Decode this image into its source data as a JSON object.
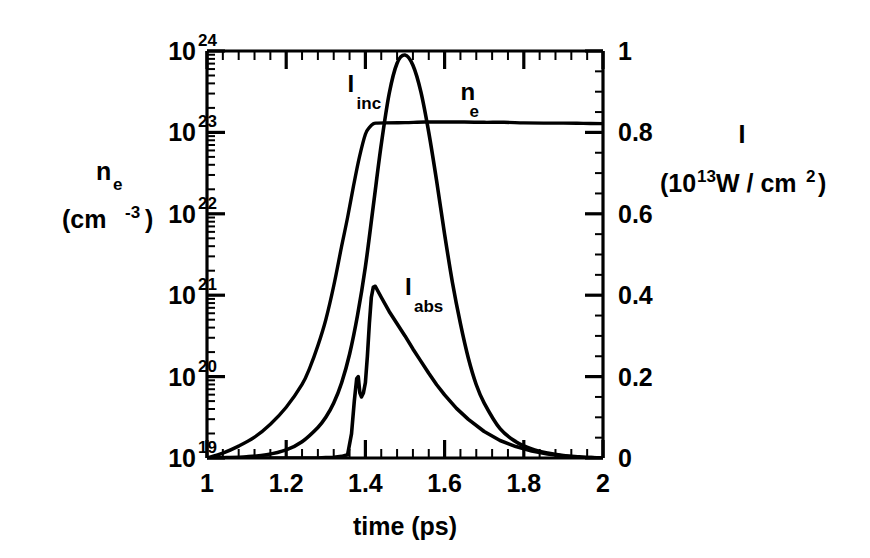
{
  "chart_data": {
    "type": "line",
    "title": "",
    "subtitle": "",
    "xlabel": "time (ps)",
    "ylabel_left": "n_e (cm^-3)",
    "ylabel_right": "I (10^13 W / cm^2)",
    "xlim": [
      1,
      2
    ],
    "xticks": [
      1,
      1.2,
      1.4,
      1.6,
      1.8,
      2
    ],
    "xticklabels": [
      "1",
      "1.2",
      "1.4",
      "1.6",
      "1.8",
      "2"
    ],
    "xminor_count": 4,
    "left_axis": {
      "scale": "log",
      "ylim": [
        1e+19,
        1e+24
      ],
      "ticks": [
        1e+19,
        1e+20,
        1e+21,
        1e+22,
        1e+23,
        1e+24
      ],
      "ticklabels": [
        "10",
        "10",
        "10",
        "10",
        "10",
        "10"
      ],
      "exponents": [
        "19",
        "20",
        "21",
        "22",
        "23",
        "24"
      ],
      "label_main": "n",
      "label_sub": "e",
      "label_units": "(cm",
      "label_units_exp": "-3",
      "label_units_close": ")"
    },
    "right_axis": {
      "scale": "linear",
      "ylim": [
        0,
        1
      ],
      "ticks": [
        0,
        0.2,
        0.4,
        0.6,
        0.8,
        1
      ],
      "ticklabels": [
        "0",
        "0.2",
        "0.4",
        "0.6",
        "0.8",
        "1"
      ],
      "label_main": "I",
      "label_units_open": "(10",
      "label_units_exp": "13",
      "label_units_mid": " W / cm",
      "label_units_exp2": "2",
      "label_units_close": ")"
    },
    "grid": false,
    "legend_position": "inline-annotations",
    "annotations": [
      {
        "name": "I_inc",
        "base": "I",
        "sub": "inc",
        "x": 1.355,
        "y_px": 92
      },
      {
        "name": "n_e",
        "base": "n",
        "sub": "e",
        "x": 1.64,
        "y_px": 100
      },
      {
        "name": "I_abs",
        "base": "I",
        "sub": "abs",
        "x": 1.5,
        "y_px": 295
      }
    ],
    "series": [
      {
        "name": "n_e",
        "axis": "left",
        "units": "cm^-3",
        "x": [
          1.0,
          1.04,
          1.08,
          1.12,
          1.16,
          1.2,
          1.24,
          1.26,
          1.28,
          1.3,
          1.32,
          1.34,
          1.355,
          1.37,
          1.385,
          1.4,
          1.41,
          1.42,
          1.43,
          1.45,
          1.5,
          1.55,
          1.6,
          1.65,
          1.7,
          1.75,
          1.8,
          1.85,
          1.9,
          1.95,
          2.0
        ],
        "y": [
          1e+19,
          1.15e+19,
          1.4e+19,
          1.8e+19,
          2.6e+19,
          4.2e+19,
          8e+19,
          1.3e+20,
          2.4e+20,
          5e+20,
          1.3e+21,
          4e+21,
          9e+21,
          2.2e+22,
          5e+22,
          9.5e+22,
          1.15e+23,
          1.28e+23,
          1.3e+23,
          1.31e+23,
          1.32e+23,
          1.34e+23,
          1.34e+23,
          1.34e+23,
          1.33e+23,
          1.33e+23,
          1.31e+23,
          1.3e+23,
          1.3e+23,
          1.29e+23,
          1.28e+23
        ]
      },
      {
        "name": "I_inc",
        "axis": "right",
        "units": "10^13 W/cm^2",
        "x": [
          1.0,
          1.05,
          1.1,
          1.15,
          1.2,
          1.24,
          1.28,
          1.3,
          1.32,
          1.34,
          1.36,
          1.38,
          1.4,
          1.42,
          1.44,
          1.46,
          1.48,
          1.5,
          1.52,
          1.54,
          1.56,
          1.58,
          1.6,
          1.62,
          1.64,
          1.66,
          1.68,
          1.7,
          1.74,
          1.78,
          1.82,
          1.86,
          1.9,
          1.94,
          1.97,
          2.0
        ],
        "y": [
          0.0,
          0.001,
          0.003,
          0.008,
          0.02,
          0.04,
          0.075,
          0.1,
          0.135,
          0.185,
          0.255,
          0.35,
          0.47,
          0.62,
          0.77,
          0.895,
          0.97,
          0.99,
          0.965,
          0.9,
          0.8,
          0.68,
          0.55,
          0.43,
          0.33,
          0.245,
          0.18,
          0.135,
          0.072,
          0.04,
          0.022,
          0.012,
          0.006,
          0.003,
          0.001,
          0.0
        ]
      },
      {
        "name": "I_abs",
        "axis": "right",
        "units": "10^13 W/cm^2",
        "x": [
          1.0,
          1.28,
          1.3,
          1.32,
          1.34,
          1.355,
          1.365,
          1.372,
          1.378,
          1.382,
          1.386,
          1.39,
          1.395,
          1.4,
          1.405,
          1.41,
          1.415,
          1.42,
          1.425,
          1.44,
          1.46,
          1.48,
          1.5,
          1.52,
          1.54,
          1.56,
          1.58,
          1.6,
          1.63,
          1.66,
          1.7,
          1.74,
          1.78,
          1.82,
          1.86,
          1.9,
          1.94,
          1.97,
          2.0
        ],
        "y": [
          0.0,
          0.0,
          0.001,
          0.002,
          0.004,
          0.008,
          0.06,
          0.14,
          0.195,
          0.2,
          0.16,
          0.15,
          0.16,
          0.185,
          0.25,
          0.33,
          0.395,
          0.42,
          0.422,
          0.395,
          0.36,
          0.33,
          0.3,
          0.268,
          0.238,
          0.208,
          0.18,
          0.155,
          0.122,
          0.095,
          0.065,
          0.043,
          0.028,
          0.017,
          0.01,
          0.005,
          0.002,
          0.001,
          0.0
        ]
      }
    ],
    "colors": {
      "line": "#000000",
      "axis": "#000000",
      "background": "#ffffff"
    }
  }
}
